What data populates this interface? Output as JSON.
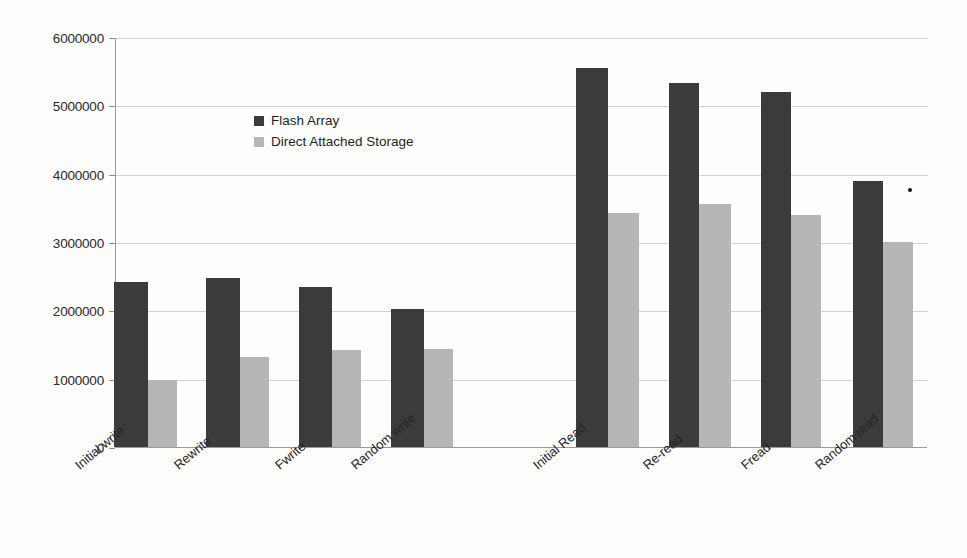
{
  "chart_data": {
    "type": "bar",
    "title": "",
    "subtitle": "",
    "xlabel": "",
    "ylabel": "",
    "categories": [
      "Initial write",
      "Rewrite",
      "Fwrite",
      "Random write",
      "",
      "Initial Read",
      "Re-read",
      "Fread",
      "Random read"
    ],
    "series": [
      {
        "name": "Flash Array",
        "color": "#3b3b3b",
        "values": [
          2410000,
          2470000,
          2340000,
          2020000,
          null,
          5540000,
          5330000,
          5190000,
          3890000
        ]
      },
      {
        "name": "Direct Attached Storage",
        "color": "#b6b6b6",
        "values": [
          980000,
          1320000,
          1420000,
          1440000,
          null,
          3420000,
          3550000,
          3400000,
          3000000
        ]
      }
    ],
    "ylim": [
      0,
      6000000
    ],
    "ytick_values": [
      0,
      1000000,
      2000000,
      3000000,
      4000000,
      5000000,
      6000000
    ],
    "ytick_labels": [
      "0",
      "1000000",
      "2000000",
      "3000000",
      "4000000",
      "5000000",
      "6000000"
    ],
    "grid": "horizontal",
    "legend_position": "inside-upper-left",
    "annotations": []
  },
  "legend": {
    "items": [
      {
        "label": "Flash Array",
        "swatch": "flash"
      },
      {
        "label": "Direct Attached Storage",
        "swatch": "das"
      }
    ]
  },
  "colors": {
    "flash_array": "#3b3b3b",
    "direct_attached_storage": "#b6b6b6",
    "gridline": "#d2d2d2",
    "axis": "#9a9a9a",
    "background": "#fdfdfc"
  }
}
